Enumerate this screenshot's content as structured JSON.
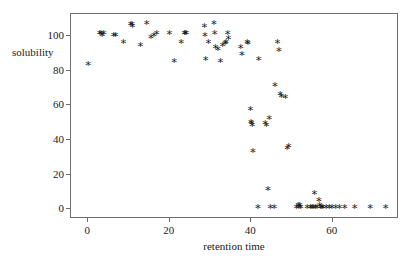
{
  "chart_data": {
    "type": "scatter",
    "title": "",
    "xlabel": "retention time",
    "ylabel": "solubility",
    "xlim": [
      -4,
      76
    ],
    "ylim": [
      -5,
      112
    ],
    "xticks": [
      0,
      20,
      40,
      60
    ],
    "yticks": [
      0,
      20,
      40,
      60,
      80,
      100
    ],
    "xtick_labels": [
      "0",
      "20",
      "40",
      "60"
    ],
    "ytick_labels": [
      "0",
      "20",
      "40",
      "60",
      "80",
      "100"
    ],
    "grid": false,
    "legend": null,
    "marker": "asterisk",
    "marker_color": "#1a1a1a",
    "series": [
      {
        "name": "samples",
        "points": [
          [
            0.2,
            83
          ],
          [
            3.0,
            101
          ],
          [
            3.3,
            101
          ],
          [
            3.6,
            100
          ],
          [
            4.0,
            101
          ],
          [
            6.4,
            100
          ],
          [
            6.9,
            100
          ],
          [
            8.8,
            96
          ],
          [
            10.6,
            106
          ],
          [
            10.9,
            106
          ],
          [
            11.0,
            105
          ],
          [
            13.0,
            94
          ],
          [
            14.5,
            107
          ],
          [
            15.6,
            99
          ],
          [
            16.3,
            100
          ],
          [
            17.0,
            101
          ],
          [
            20.1,
            101
          ],
          [
            21.3,
            85
          ],
          [
            23.0,
            96
          ],
          [
            23.8,
            101
          ],
          [
            24.0,
            101
          ],
          [
            24.2,
            101
          ],
          [
            28.7,
            105
          ],
          [
            28.8,
            100
          ],
          [
            29.0,
            86
          ],
          [
            29.7,
            96
          ],
          [
            31.0,
            107
          ],
          [
            31.2,
            101
          ],
          [
            31.4,
            93
          ],
          [
            32.0,
            92
          ],
          [
            32.6,
            85
          ],
          [
            33.2,
            94
          ],
          [
            33.8,
            95
          ],
          [
            34.0,
            96
          ],
          [
            34.4,
            101
          ],
          [
            34.6,
            98
          ],
          [
            37.6,
            93
          ],
          [
            37.9,
            89
          ],
          [
            39.2,
            96
          ],
          [
            39.4,
            95
          ],
          [
            40.0,
            57
          ],
          [
            40.1,
            50
          ],
          [
            40.3,
            49
          ],
          [
            40.4,
            48
          ],
          [
            40.6,
            33
          ],
          [
            41.8,
            1
          ],
          [
            42.0,
            86
          ],
          [
            43.6,
            49
          ],
          [
            43.9,
            48
          ],
          [
            44.3,
            11
          ],
          [
            44.6,
            52
          ],
          [
            44.9,
            1
          ],
          [
            45.8,
            1
          ],
          [
            46.0,
            71
          ],
          [
            46.6,
            96
          ],
          [
            47.0,
            91
          ],
          [
            47.3,
            66
          ],
          [
            47.6,
            65
          ],
          [
            48.6,
            64
          ],
          [
            49.0,
            35
          ],
          [
            49.4,
            36
          ],
          [
            51.3,
            1
          ],
          [
            51.7,
            2
          ],
          [
            51.9,
            1
          ],
          [
            52.1,
            2
          ],
          [
            52.3,
            1
          ],
          [
            53.9,
            1
          ],
          [
            54.7,
            1
          ],
          [
            55.1,
            1
          ],
          [
            55.4,
            1
          ],
          [
            55.7,
            9
          ],
          [
            55.9,
            1
          ],
          [
            56.3,
            1
          ],
          [
            56.8,
            5
          ],
          [
            57.0,
            2
          ],
          [
            57.2,
            1
          ],
          [
            57.5,
            1
          ],
          [
            57.8,
            1
          ],
          [
            58.6,
            1
          ],
          [
            59.3,
            1
          ],
          [
            60.0,
            1
          ],
          [
            60.9,
            1
          ],
          [
            61.8,
            1
          ],
          [
            63.1,
            1
          ],
          [
            65.6,
            1
          ],
          [
            69.4,
            1
          ],
          [
            73.2,
            1
          ]
        ]
      }
    ]
  },
  "axes": {
    "frame_color": "#6d6d6d"
  }
}
